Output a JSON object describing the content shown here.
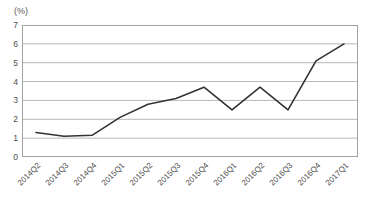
{
  "chart_data": {
    "type": "line",
    "title": "",
    "subtitle": "",
    "xlabel": "",
    "ylabel": "(%)",
    "unit_label": "(%)",
    "categories": [
      "2014Q2",
      "2014Q3",
      "2014Q4",
      "2015Q1",
      "2015Q2",
      "2015Q3",
      "2015Q4",
      "2016Q1",
      "2016Q2",
      "2016Q3",
      "2016Q4",
      "2017Q1"
    ],
    "values": [
      1.3,
      1.1,
      1.15,
      2.1,
      2.8,
      3.1,
      3.7,
      2.5,
      3.7,
      2.5,
      5.1,
      6.0
    ],
    "series": [
      {
        "name": "",
        "values": [
          1.3,
          1.1,
          1.15,
          2.1,
          2.8,
          3.1,
          3.7,
          2.5,
          3.7,
          2.5,
          5.1,
          6.0
        ]
      }
    ],
    "ylim": [
      0,
      7
    ],
    "yticks": [
      0,
      1,
      2,
      3,
      4,
      5,
      6,
      7
    ],
    "ytick_labels": [
      "0",
      "1",
      "2",
      "3",
      "4",
      "5",
      "6",
      "7"
    ],
    "xtick_labels": [
      "2014Q2",
      "2014Q3",
      "2014Q4",
      "2015Q1",
      "2015Q2",
      "2015Q3",
      "2015Q4",
      "2016Q1",
      "2016Q2",
      "2016Q3",
      "2016Q4",
      "2017Q1"
    ],
    "grid": true,
    "grid_axis": "y",
    "legend": false,
    "legend_position": "none",
    "markers": false,
    "line_color": "#333333",
    "line_width": 1.6,
    "grid_color": "#a6a6a6",
    "axis_color": "#999999",
    "text_color": "#4d4d4d",
    "background": "#ffffff",
    "annotations": []
  }
}
